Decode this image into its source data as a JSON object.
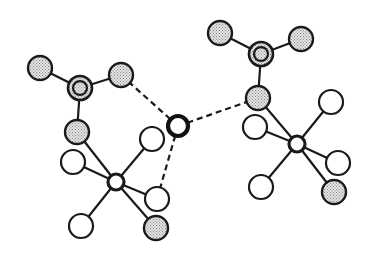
{
  "diagram": {
    "type": "molecular-structure",
    "width": 367,
    "height": 254,
    "colors": {
      "background": "#ffffff",
      "stroke": "#1a1a1a",
      "shaded_fill": "#c8c8c8",
      "white_fill": "#ffffff"
    },
    "legend": {
      "shaded": "shaded atom (stippled)",
      "white": "open atom",
      "double_ring": "central atom of trigonal group",
      "metal": "metal center",
      "bold": "bridging central atom"
    },
    "atoms": [
      {
        "id": "L_top_left",
        "group": "left",
        "x": 40,
        "y": 68,
        "r": 12,
        "style": "shaded"
      },
      {
        "id": "L_center",
        "group": "left",
        "x": 80,
        "y": 88,
        "r": 12,
        "style": "double_ring"
      },
      {
        "id": "L_top_right",
        "group": "left",
        "x": 121,
        "y": 75,
        "r": 12,
        "style": "shaded"
      },
      {
        "id": "L_lower",
        "group": "left",
        "x": 77,
        "y": 132,
        "r": 12,
        "style": "shaded"
      },
      {
        "id": "L_metal",
        "group": "left",
        "x": 116,
        "y": 182,
        "r": 8,
        "style": "metal"
      },
      {
        "id": "L_w_upper_left",
        "group": "left",
        "x": 73,
        "y": 162,
        "r": 12,
        "style": "white"
      },
      {
        "id": "L_w_upper_right",
        "group": "left",
        "x": 152,
        "y": 139,
        "r": 12,
        "style": "white"
      },
      {
        "id": "L_w_right",
        "group": "left",
        "x": 157,
        "y": 199,
        "r": 12,
        "style": "white"
      },
      {
        "id": "L_s_lower_right",
        "group": "left",
        "x": 156,
        "y": 228,
        "r": 12,
        "style": "shaded"
      },
      {
        "id": "L_w_lower_left",
        "group": "left",
        "x": 81,
        "y": 226,
        "r": 12,
        "style": "white"
      },
      {
        "id": "C_bold",
        "group": "center",
        "x": 178,
        "y": 126,
        "r": 10,
        "style": "bold"
      },
      {
        "id": "R_top_left",
        "group": "right",
        "x": 220,
        "y": 33,
        "r": 12,
        "style": "shaded"
      },
      {
        "id": "R_center",
        "group": "right",
        "x": 261,
        "y": 54,
        "r": 12,
        "style": "double_ring"
      },
      {
        "id": "R_top_right",
        "group": "right",
        "x": 301,
        "y": 39,
        "r": 12,
        "style": "shaded"
      },
      {
        "id": "R_lower",
        "group": "right",
        "x": 258,
        "y": 98,
        "r": 12,
        "style": "shaded"
      },
      {
        "id": "R_metal",
        "group": "right",
        "x": 297,
        "y": 144,
        "r": 8,
        "style": "metal"
      },
      {
        "id": "R_w_left",
        "group": "right",
        "x": 255,
        "y": 127,
        "r": 12,
        "style": "white"
      },
      {
        "id": "R_w_upper_right",
        "group": "right",
        "x": 331,
        "y": 102,
        "r": 12,
        "style": "white"
      },
      {
        "id": "R_w_right",
        "group": "right",
        "x": 338,
        "y": 163,
        "r": 12,
        "style": "white"
      },
      {
        "id": "R_s_lower_right",
        "group": "right",
        "x": 334,
        "y": 192,
        "r": 12,
        "style": "shaded"
      },
      {
        "id": "R_w_lower_left",
        "group": "right",
        "x": 261,
        "y": 187,
        "r": 12,
        "style": "white"
      }
    ],
    "bonds": [
      {
        "from": "L_top_left",
        "to": "L_center",
        "style": "solid"
      },
      {
        "from": "L_center",
        "to": "L_top_right",
        "style": "solid"
      },
      {
        "from": "L_center",
        "to": "L_lower",
        "style": "solid"
      },
      {
        "from": "L_lower",
        "to": "L_metal",
        "style": "solid"
      },
      {
        "from": "L_metal",
        "to": "L_w_upper_left",
        "style": "solid"
      },
      {
        "from": "L_metal",
        "to": "L_w_upper_right",
        "style": "solid"
      },
      {
        "from": "L_metal",
        "to": "L_w_right",
        "style": "solid"
      },
      {
        "from": "L_metal",
        "to": "L_s_lower_right",
        "style": "solid"
      },
      {
        "from": "L_metal",
        "to": "L_w_lower_left",
        "style": "solid"
      },
      {
        "from": "R_top_left",
        "to": "R_center",
        "style": "solid"
      },
      {
        "from": "R_center",
        "to": "R_top_right",
        "style": "solid"
      },
      {
        "from": "R_center",
        "to": "R_lower",
        "style": "solid"
      },
      {
        "from": "R_lower",
        "to": "R_metal",
        "style": "solid"
      },
      {
        "from": "R_metal",
        "to": "R_w_left",
        "style": "solid"
      },
      {
        "from": "R_metal",
        "to": "R_w_upper_right",
        "style": "solid"
      },
      {
        "from": "R_metal",
        "to": "R_w_right",
        "style": "solid"
      },
      {
        "from": "R_metal",
        "to": "R_s_lower_right",
        "style": "solid"
      },
      {
        "from": "R_metal",
        "to": "R_w_lower_left",
        "style": "solid"
      },
      {
        "from": "L_top_right",
        "to": "C_bold",
        "style": "dashed"
      },
      {
        "from": "C_bold",
        "to": "R_lower",
        "style": "dashed"
      },
      {
        "from": "C_bold",
        "to": "L_w_right",
        "style": "dashed"
      }
    ]
  }
}
